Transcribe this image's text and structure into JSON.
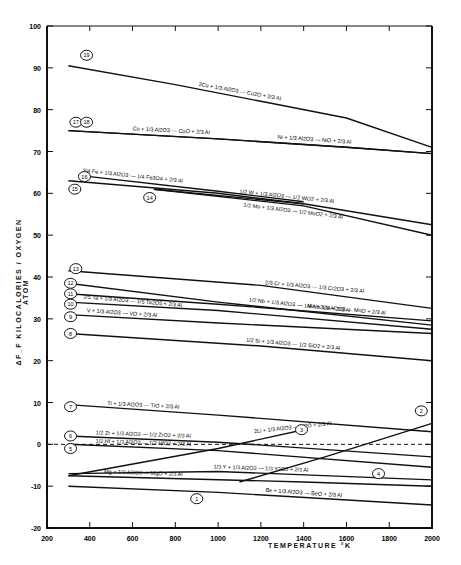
{
  "chart_data": {
    "type": "line",
    "title": "",
    "xlabel": "TEMPERATURE °K",
    "ylabel": "ΔF_F KILOCALORIES / OXYGEN ATOM",
    "xlim": [
      200,
      2000
    ],
    "ylim": [
      -20,
      100
    ],
    "xticks": [
      200,
      400,
      600,
      800,
      1000,
      1200,
      1400,
      1600,
      1800,
      2000
    ],
    "yticks": [
      -20,
      -10,
      0,
      10,
      20,
      30,
      40,
      50,
      60,
      70,
      80,
      90,
      100
    ],
    "grid": false,
    "legend": "inline labels",
    "reference_line": {
      "y": 0,
      "style": "dashed"
    },
    "series": [
      {
        "id": 19,
        "name": "2Cu + 1/3 Al2O3 — Cu2O + 2/3 Al",
        "x": [
          300,
          800,
          1200,
          1600,
          2000
        ],
        "y": [
          90.5,
          86,
          82,
          78,
          71
        ]
      },
      {
        "id": 18,
        "name": "Ni + 1/3 Al2O3 — NiO + 2/3 Al",
        "x": [
          300,
          1000,
          1600,
          2000
        ],
        "y": [
          75,
          73,
          71,
          69.5
        ]
      },
      {
        "id": 17,
        "name": "Co + 1/3 Al2O3 — CoO + 2/3 Al",
        "x": [
          300,
          1000,
          1600,
          2000
        ],
        "y": [
          75,
          73,
          71,
          69.5
        ]
      },
      {
        "id": 16,
        "name": "3/4 Fe + 1/3 Al2O3 — 1/4 Fe3O4 + 2/3 Al",
        "x": [
          400,
          1000,
          1400
        ],
        "y": [
          64,
          60.5,
          58
        ]
      },
      {
        "id": 15,
        "name": "3/4 Fe + 1/3 Al2O3 — 1/4 Fe3O4 + 2/3 Al (15)",
        "x": [
          300,
          1000,
          1400
        ],
        "y": [
          63,
          60,
          57.5
        ]
      },
      {
        "id": 14,
        "name": "1/2 W + 1/3 Al2O3 — 1/2 WO2 + 2/3 Al",
        "x": [
          700,
          1400,
          2000
        ],
        "y": [
          61,
          57.5,
          52.5
        ]
      },
      {
        "id": "Mo",
        "name": "1/2 Mo + 1/3 Al2O3 — 1/2 MoO2 + 2/3 Al",
        "x": [
          700,
          1400,
          2000
        ],
        "y": [
          61,
          57,
          50
        ]
      },
      {
        "id": 13,
        "name": "2/3 Cr + 1/3 Al2O3 — 1/3 Cr2O3 + 2/3 Al",
        "x": [
          300,
          1200,
          2000
        ],
        "y": [
          41.5,
          38,
          32.5
        ]
      },
      {
        "id": 12,
        "name": "1/2 Nb + 1/3 Al2O3 — 1/4 Nb2O4 + 2/3 Al",
        "x": [
          300,
          1000,
          2000
        ],
        "y": [
          38.5,
          34,
          28.5
        ]
      },
      {
        "id": 11,
        "name": "Mn + 1/3 Al2O3 — MnO + 2/3 Al",
        "x": [
          300,
          1000,
          2000
        ],
        "y": [
          36,
          33.5,
          29.5
        ]
      },
      {
        "id": 10,
        "name": "2/5 Ta + 1/3 Al2O3 — 1/5 Ta2O5 + 2/3 Al",
        "x": [
          300,
          1000,
          2000
        ],
        "y": [
          34,
          32,
          27.5
        ]
      },
      {
        "id": 9,
        "name": "V + 1/3 Al2O3 — VO + 2/3 Al",
        "x": [
          300,
          1000,
          2000
        ],
        "y": [
          31,
          29,
          26.5
        ]
      },
      {
        "id": 8,
        "name": "1/2 Si + 1/3 Al2O3 — 1/2 SiO2 + 2/3 Al",
        "x": [
          300,
          1200,
          2000
        ],
        "y": [
          26.5,
          23.5,
          20
        ]
      },
      {
        "id": 7,
        "name": "Ti + 1/3 Al2O3 — TiO + 2/3 Al",
        "x": [
          300,
          1000,
          2000
        ],
        "y": [
          9.5,
          7,
          3
        ]
      },
      {
        "id": 6,
        "name": "1/2 Zr + 1/3 Al2O3 — 1/2 ZrO2 + 2/3 Al",
        "x": [
          300,
          1000,
          2000
        ],
        "y": [
          2,
          0.5,
          -3
        ]
      },
      {
        "id": 5,
        "name": "1/2 Hf + 1/3 Al2O3 — 1/2 HfO2 + 2/3 Al",
        "x": [
          300,
          1000,
          2000
        ],
        "y": [
          0,
          -1.5,
          -5.5
        ]
      },
      {
        "id": 3,
        "name": "2Li + 1/3 Al2O3 — Li2O + 2/3 Al",
        "x": [
          300,
          1000,
          1400
        ],
        "y": [
          -7.5,
          -1,
          3.5
        ]
      },
      {
        "id": 2,
        "name": "2 (Li line, high-T)",
        "x": [
          1100,
          1500,
          2000
        ],
        "y": [
          -9,
          -3,
          5
        ]
      },
      {
        "id": "Y",
        "name": "1/3 Y + 1/3 Al2O3 — 1/3 Y2O3 + 2/3 Al",
        "x": [
          300,
          1000,
          2000
        ],
        "y": [
          -7,
          -6.5,
          -8.5
        ]
      },
      {
        "id": 4,
        "name": "Mg + 1/3 Al2O3 — MgO + 2/3 Al",
        "x": [
          300,
          1400,
          2000
        ],
        "y": [
          -7.5,
          -9,
          -10
        ]
      },
      {
        "id": 1,
        "name": "Be + 1/3 Al2O3 — BeO + 2/3 Al",
        "x": [
          300,
          1000,
          2000
        ],
        "y": [
          -10,
          -11.5,
          -14.5
        ]
      }
    ],
    "annotations": [
      {
        "text": "19",
        "x": 385,
        "y": 93
      },
      {
        "text": "17",
        "x": 335,
        "y": 77
      },
      {
        "text": "18",
        "x": 385,
        "y": 77
      },
      {
        "text": "16",
        "x": 375,
        "y": 64
      },
      {
        "text": "15",
        "x": 330,
        "y": 61
      },
      {
        "text": "14",
        "x": 680,
        "y": 59
      },
      {
        "text": "13",
        "x": 335,
        "y": 42
      },
      {
        "text": "12",
        "x": 310,
        "y": 38.5
      },
      {
        "text": "11",
        "x": 310,
        "y": 36
      },
      {
        "text": "10",
        "x": 310,
        "y": 33.5
      },
      {
        "text": "9",
        "x": 310,
        "y": 30.5
      },
      {
        "text": "8",
        "x": 310,
        "y": 26.5
      },
      {
        "text": "7",
        "x": 310,
        "y": 9
      },
      {
        "text": "6",
        "x": 310,
        "y": 2
      },
      {
        "text": "5",
        "x": 310,
        "y": -1
      },
      {
        "text": "3",
        "x": 1390,
        "y": 3.5
      },
      {
        "text": "2",
        "x": 1950,
        "y": 8
      },
      {
        "text": "4",
        "x": 1750,
        "y": -7
      },
      {
        "text": "1",
        "x": 900,
        "y": -13
      }
    ]
  },
  "labels": {
    "ylabel": "ΔF_F   KILOCALORIES / OXYGEN ATOM",
    "xlabel": "TEMPERATURE °K"
  }
}
